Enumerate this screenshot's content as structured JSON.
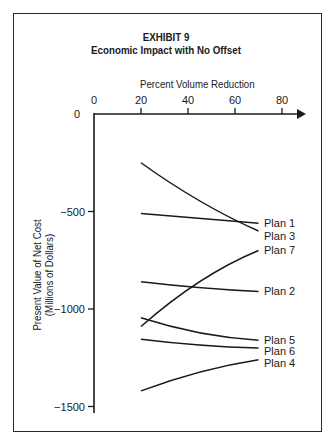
{
  "chart_data": {
    "type": "line",
    "title": "EXHIBIT 9",
    "subtitle": "Economic Impact with No Offset",
    "xlabel": "Percent Volume Reduction",
    "ylabel": "Present Value of Net Cost (Millions of Dollars)",
    "ylabel_lines": [
      "Present Value of Net Cost",
      "(Millions of Dollars)"
    ],
    "x_ticks": [
      "0",
      "20",
      "40",
      "60",
      "80"
    ],
    "y_ticks": [
      "0",
      "-500",
      "-1000",
      "-1500"
    ],
    "xlim": [
      0,
      85
    ],
    "ylim": [
      -1500,
      0
    ],
    "x_axis_position": "top",
    "grid": false,
    "legend_position": "inline-right",
    "x": [
      20,
      40,
      70
    ],
    "series": [
      {
        "name": "Plan 1",
        "values": [
          -510,
          -530,
          -560
        ]
      },
      {
        "name": "Plan 3",
        "values": [
          -250,
          -410,
          -600
        ]
      },
      {
        "name": "Plan 7",
        "values": [
          -1090,
          -900,
          -700
        ]
      },
      {
        "name": "Plan 2",
        "values": [
          -860,
          -885,
          -910
        ]
      },
      {
        "name": "Plan 5",
        "values": [
          -1045,
          -1110,
          -1160
        ]
      },
      {
        "name": "Plan 6",
        "values": [
          -1155,
          -1180,
          -1200
        ]
      },
      {
        "name": "Plan 4",
        "values": [
          -1420,
          -1340,
          -1260
        ]
      }
    ]
  }
}
